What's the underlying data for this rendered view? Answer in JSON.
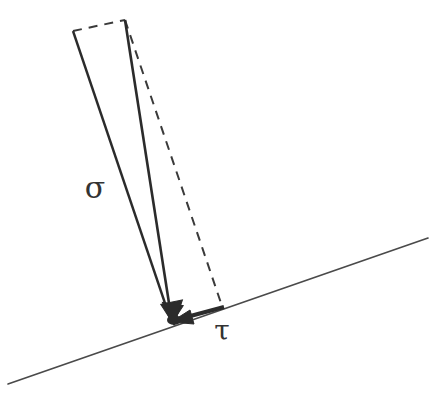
{
  "figure": {
    "background_color": "#ffffff",
    "width": 444,
    "height": 420,
    "stroke_color_dark": "#2b2b2b",
    "stroke_color_mid": "#3a3a3a",
    "stroke_color_light": "#555555"
  },
  "labels": {
    "sigma": {
      "text": "σ",
      "name": "normal-stress-label",
      "x": 95,
      "y": 198,
      "font_size": 30
    },
    "tau": {
      "text": "τ",
      "name": "shear-stress-label",
      "x": 222,
      "y": 340,
      "font_size": 28
    }
  },
  "geometry": {
    "apex": {
      "x": 125,
      "y": 20
    },
    "foot": {
      "x": 172,
      "y": 322
    },
    "left_corner": {
      "x": 73,
      "y": 31
    },
    "right_corner": {
      "x": 223,
      "y": 309
    },
    "baseline_start": {
      "x": 8,
      "y": 384
    },
    "baseline_end": {
      "x": 428,
      "y": 238
    },
    "resultant_vector": {
      "from": "apex",
      "to": "foot",
      "style": "solid",
      "arrow": true
    },
    "normal_vector": {
      "from": "left_corner",
      "to": "foot",
      "style": "solid",
      "arrow": true
    },
    "shear_vector": {
      "from": "right_corner",
      "to": "foot",
      "style": "solid",
      "arrow": true
    },
    "dashed_top": {
      "from": "left_corner",
      "to": "apex",
      "style": "dashed"
    },
    "dashed_right": {
      "from": "apex",
      "to": "right_corner",
      "style": "dashed"
    }
  },
  "chart_data": {
    "type": "diagram",
    "annotations": [
      {
        "symbol": "σ",
        "meaning": "normal stress component",
        "position": [
          95,
          198
        ]
      },
      {
        "symbol": "τ",
        "meaning": "shear stress component",
        "position": [
          222,
          340
        ]
      }
    ],
    "elements": [
      {
        "name": "inclined-plane-baseline",
        "type": "line",
        "points": [
          [
            8,
            384
          ],
          [
            428,
            238
          ]
        ],
        "style": "solid",
        "width": 1.6
      },
      {
        "name": "resultant-traction-vector",
        "type": "arrow",
        "points": [
          [
            125,
            20
          ],
          [
            172,
            322
          ]
        ],
        "style": "solid",
        "width": 2.6
      },
      {
        "name": "normal-component-vector",
        "type": "arrow",
        "points": [
          [
            73,
            31
          ],
          [
            172,
            322
          ]
        ],
        "style": "solid",
        "width": 2.4
      },
      {
        "name": "shear-component-vector",
        "type": "arrow",
        "points": [
          [
            223,
            309
          ],
          [
            172,
            322
          ]
        ],
        "style": "solid",
        "width": 4.0
      },
      {
        "name": "parallelogram-dashed-top",
        "type": "line",
        "points": [
          [
            73,
            31
          ],
          [
            125,
            20
          ]
        ],
        "style": "dashed",
        "width": 2.0
      },
      {
        "name": "parallelogram-dashed-side",
        "type": "line",
        "points": [
          [
            125,
            20
          ],
          [
            223,
            309
          ]
        ],
        "style": "dashed",
        "width": 2.0
      }
    ],
    "legend": [],
    "grid": false
  }
}
